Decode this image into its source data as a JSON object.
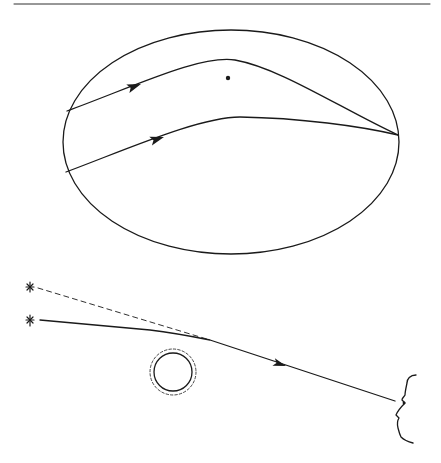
{
  "figure": {
    "colors": {
      "ink": "#1a1a1a",
      "background": "#ffffff"
    },
    "top_rule": {
      "x1": 14,
      "x2": 430,
      "y": 4
    },
    "inset": {
      "shape": "ellipse",
      "cx": 231,
      "cy": 142,
      "rx": 168,
      "ry": 112,
      "point_mass": {
        "cx": 228,
        "cy": 78,
        "r": 2.2
      },
      "rays": [
        {
          "name": "upper-ray",
          "path": "M67,111 C140,84 200,55 235,60 C280,68 340,108 398,135",
          "arrow": {
            "x": 140,
            "y": 84,
            "angle": -20
          }
        },
        {
          "name": "lower-ray",
          "path": "M66,172 C130,148 200,117 240,117 C300,118 360,126 398,135",
          "arrow": {
            "x": 163,
            "y": 137,
            "angle": -18
          }
        }
      ]
    },
    "scene": {
      "apparent_star": {
        "x": 30,
        "y": 287,
        "label": "apparent-position"
      },
      "true_star": {
        "x": 30,
        "y": 320,
        "label": "true-position"
      },
      "apparent_ray": {
        "x1": 38,
        "y1": 288,
        "x2": 210,
        "y2": 340
      },
      "true_ray": {
        "path": "M40,320 L150,330 C175,333 195,337 210,340 L395,401"
      },
      "ray_arrow": {
        "x": 285,
        "y": 367,
        "angle": 18
      },
      "mass": {
        "cx": 173,
        "cy": 372,
        "r": 19,
        "halo_r": 23
      },
      "observer_face": {
        "path": "M416,375 C410,375 407,379 407,383 C406,388 405,392 405,395 C404,397 402,398 402,400 L405,403 C402,406 398,410 396,415 L399,418 C397,421 397,424 398,428 C399,432 400,435 401,437 C404,440 409,442 413,443"
      }
    }
  }
}
